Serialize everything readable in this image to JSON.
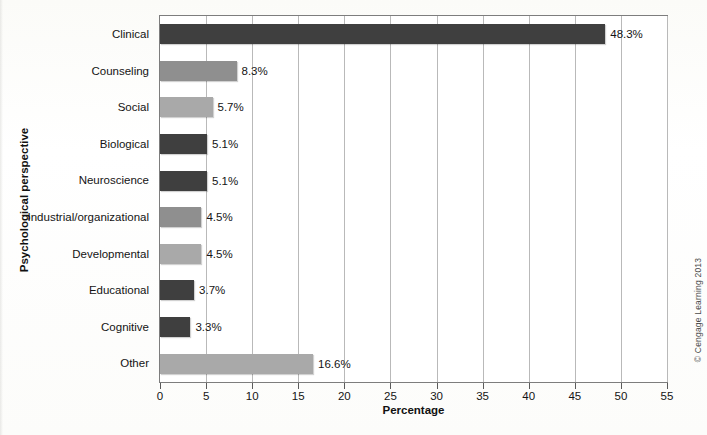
{
  "chart_data": {
    "type": "bar",
    "orientation": "horizontal",
    "title": "",
    "xlabel": "Percentage",
    "ylabel": "Psychological perspective",
    "xlim": [
      0,
      55
    ],
    "xticks": [
      0,
      5,
      10,
      15,
      20,
      25,
      30,
      35,
      40,
      45,
      50,
      55
    ],
    "grid": "vertical",
    "legend": "none",
    "categories": [
      "Clinical",
      "Counseling",
      "Social",
      "Biological",
      "Neuroscience",
      "Industrial/organizational",
      "Developmental",
      "Educational",
      "Cognitive",
      "Other"
    ],
    "values": [
      48.3,
      8.3,
      5.7,
      5.1,
      5.1,
      4.5,
      4.5,
      3.7,
      3.3,
      16.6
    ],
    "value_labels": [
      "48.3%",
      "8.3%",
      "5.7%",
      "5.1%",
      "5.1%",
      "4.5%",
      "4.5%",
      "3.7%",
      "3.3%",
      "16.6%"
    ],
    "bar_shades": [
      "dark",
      "mid",
      "light",
      "dark",
      "dark",
      "mid",
      "light",
      "dark",
      "dark",
      "light"
    ],
    "colors": {
      "dark": "#3f3f3f",
      "mid": "#8f8f8f",
      "light": "#a9a9a9",
      "gridline": "#b9b9b9",
      "frame": "#7d7d7d",
      "plot_background": "#ffffff",
      "page_background": "#fdfdfb",
      "text": "#141414"
    }
  },
  "credit": "© Cengage Learning 2013"
}
